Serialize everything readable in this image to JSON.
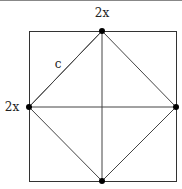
{
  "diagram": {
    "type": "geometry",
    "labels": {
      "top": "2x",
      "left": "2x",
      "inner_side": "c"
    },
    "points": [
      {
        "name": "top-midpoint"
      },
      {
        "name": "left-midpoint"
      },
      {
        "name": "right-midpoint"
      },
      {
        "name": "bottom-midpoint"
      }
    ],
    "colors": {
      "line": "#333333",
      "point": "#000000",
      "background": "#ffffff"
    }
  }
}
